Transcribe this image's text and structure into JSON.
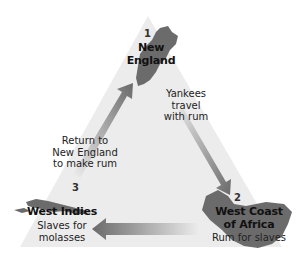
{
  "diagram": {
    "type": "triangular-trade",
    "colors": {
      "triangle_fill": "#ececec",
      "land": "#6b6b6b",
      "arrow_dark": "#6a6a6a",
      "arrow_light": "#e8e8e8",
      "text": "#111111"
    },
    "nodes": [
      {
        "number": "1",
        "name_line1": "New",
        "name_line2": "England"
      },
      {
        "number": "2",
        "name_line1": "West Coast",
        "name_line2": "of Africa",
        "description": "Rum for slaves"
      },
      {
        "number": "3",
        "name": "West Indies",
        "description_line1": "Slaves for",
        "description_line2": "molasses"
      }
    ],
    "edges": [
      {
        "from": "New England",
        "to": "West Coast of Africa",
        "label_line1": "Yankees",
        "label_line2": "travel",
        "label_line3": "with rum"
      },
      {
        "from": "West Coast of Africa",
        "to": "West Indies",
        "label": ""
      },
      {
        "from": "West Indies",
        "to": "New England",
        "label_line1": "Return to",
        "label_line2": "New England",
        "label_line3": "to make rum"
      }
    ]
  }
}
